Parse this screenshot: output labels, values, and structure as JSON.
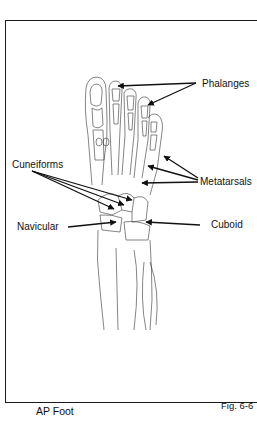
{
  "figure": {
    "caption": "AP Foot",
    "figure_number": "Fig. 6-6"
  },
  "labels": {
    "phalanges": "Phalanges",
    "metatarsals": "Metatarsals",
    "cuneiforms": "Cuneiforms",
    "navicular": "Navicular",
    "cuboid": "Cuboid"
  }
}
